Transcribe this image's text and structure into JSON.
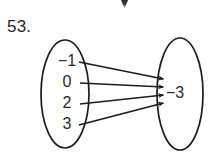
{
  "problem": {
    "number_label": "53."
  },
  "diagram": {
    "type": "mapping-diagram",
    "domain_oval": {
      "name": "domain-oval",
      "cx": 65,
      "cy": 94,
      "rx": 24,
      "ry": 54,
      "items": [
        {
          "label": "−1",
          "value": -1,
          "y": 62
        },
        {
          "label": "0",
          "value": 0,
          "y": 83
        },
        {
          "label": "2",
          "value": 2,
          "y": 104
        },
        {
          "label": "3",
          "value": 3,
          "y": 125
        }
      ]
    },
    "range_oval": {
      "name": "range-oval",
      "cx": 180,
      "cy": 94,
      "rx": 23,
      "ry": 56,
      "items": [
        {
          "label": "−3",
          "value": -3,
          "y": 94
        }
      ]
    },
    "arrows": [
      {
        "name": "arrow-neg1-to-neg3",
        "from": "−1",
        "to": "−3",
        "x1": 85,
        "y1": 62,
        "x2": 163,
        "y2": 79
      },
      {
        "name": "arrow-0-to-neg3",
        "from": "0",
        "to": "−3",
        "x1": 85,
        "y1": 83,
        "x2": 163,
        "y2": 87
      },
      {
        "name": "arrow-2-to-neg3",
        "from": "2",
        "to": "−3",
        "x1": 85,
        "y1": 104,
        "x2": 163,
        "y2": 95
      },
      {
        "name": "arrow-3-to-neg3",
        "from": "3",
        "to": "−3",
        "x1": 85,
        "y1": 125,
        "x2": 163,
        "y2": 103
      }
    ]
  },
  "colors": {
    "background": "#ffffff",
    "ink": "#1c1c1c",
    "text": "#2a2a2a",
    "speck": "#1a1a1a"
  },
  "artifacts": {
    "top_speck_label": "scan-speck"
  }
}
